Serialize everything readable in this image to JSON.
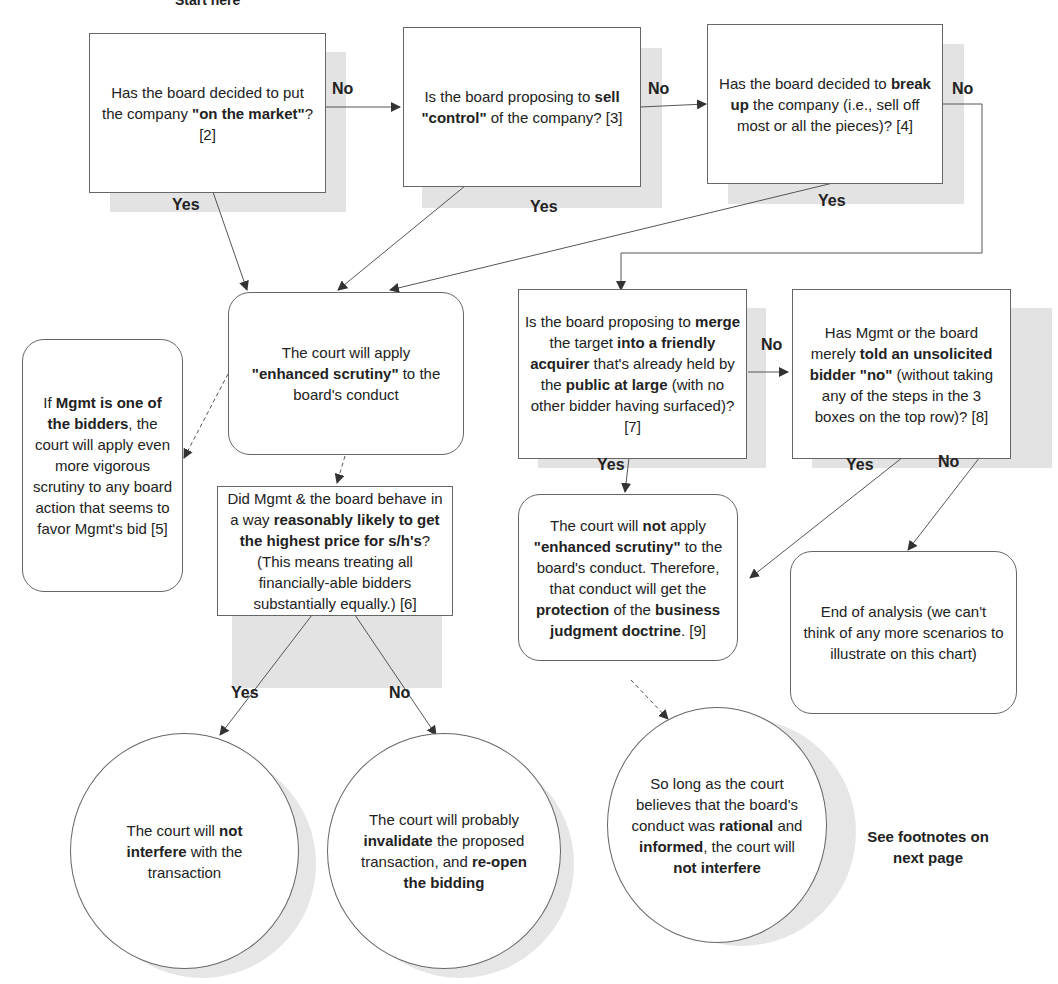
{
  "start_label": "Start here",
  "nodes": {
    "q_market": {
      "parts": [
        [
          "Has the board decided to put the company ",
          false
        ],
        [
          "\"on the market\"",
          true
        ],
        [
          "? [2]",
          false
        ]
      ]
    },
    "q_control": {
      "parts": [
        [
          "Is the board proposing to ",
          false
        ],
        [
          "sell \"control\"",
          true
        ],
        [
          " of the company? [3]",
          false
        ]
      ]
    },
    "q_breakup": {
      "parts": [
        [
          "Has the board decided to ",
          false
        ],
        [
          "break up",
          true
        ],
        [
          " the company (i.e., sell off most or all the pieces)? [4]",
          false
        ]
      ]
    },
    "enhanced": {
      "parts": [
        [
          "The court will apply ",
          false
        ],
        [
          "\"enhanced scrutiny\"",
          true
        ],
        [
          " to the board's conduct",
          false
        ]
      ]
    },
    "mgmt_bidder": {
      "parts": [
        [
          "If ",
          false
        ],
        [
          "Mgmt is one of the bidders",
          true
        ],
        [
          ", the court will apply even more vigorous scrutiny to any board action that seems to favor Mgmt's bid [5]",
          false
        ]
      ]
    },
    "q_highest": {
      "parts": [
        [
          "Did Mgmt & the board behave in a way ",
          false
        ],
        [
          "reasonably likely to get the highest price for s/h's",
          true
        ],
        [
          "? (This means treating all financially-able bidders substantially equally.) [6]",
          false
        ]
      ]
    },
    "q_merge": {
      "parts": [
        [
          "Is the board proposing to ",
          false
        ],
        [
          "merge",
          true
        ],
        [
          " the target ",
          false
        ],
        [
          "into a friendly acquirer",
          true
        ],
        [
          " that's already held by the ",
          false
        ],
        [
          "public at large",
          true
        ],
        [
          " (with no other bidder having surfaced)? [7]",
          false
        ]
      ]
    },
    "q_told_no": {
      "parts": [
        [
          "Has Mgmt or the board merely ",
          false
        ],
        [
          "told an unsolicited bidder \"no\"",
          true
        ],
        [
          " (without taking any of the steps in the 3 boxes on the top row)? [8]",
          false
        ]
      ]
    },
    "no_enhanced": {
      "parts": [
        [
          "The court will ",
          false
        ],
        [
          "not",
          true
        ],
        [
          " apply ",
          false
        ],
        [
          "\"enhanced scrutiny\"",
          true
        ],
        [
          " to the board's conduct. Therefore, that conduct will get the ",
          false
        ],
        [
          "protection",
          true
        ],
        [
          " of the ",
          false
        ],
        [
          "business judgment doctrine",
          true
        ],
        [
          ". [9]",
          false
        ]
      ]
    },
    "end": {
      "parts": [
        [
          "End of analysis (we can't think of any more scenarios to illustrate on this chart)",
          false
        ]
      ]
    },
    "not_interfere": {
      "parts": [
        [
          "The court will ",
          false
        ],
        [
          "not interfere",
          true
        ],
        [
          " with the transaction",
          false
        ]
      ]
    },
    "invalidate": {
      "parts": [
        [
          "The court will probably ",
          false
        ],
        [
          "invalidate",
          true
        ],
        [
          " the proposed transaction, and ",
          false
        ],
        [
          "re-open the bidding",
          true
        ]
      ]
    },
    "rational": {
      "parts": [
        [
          "So long as the court believes that the board's conduct was ",
          false
        ],
        [
          "rational",
          true
        ],
        [
          " and ",
          false
        ],
        [
          "informed",
          true
        ],
        [
          ", the court will ",
          false
        ],
        [
          "not interfere",
          true
        ]
      ]
    }
  },
  "edge_labels": {
    "market_no": "No",
    "market_yes": "Yes",
    "control_no": "No",
    "control_yes": "Yes",
    "breakup_no": "No",
    "breakup_yes": "Yes",
    "merge_no": "No",
    "merge_yes": "Yes",
    "told_yes": "Yes",
    "told_no": "No",
    "highest_yes": "Yes",
    "highest_no": "No"
  },
  "footnote": "See footnotes on next page",
  "colors": {
    "line": "#555555",
    "shadow": "#e3e3e3",
    "border": "#666666"
  }
}
